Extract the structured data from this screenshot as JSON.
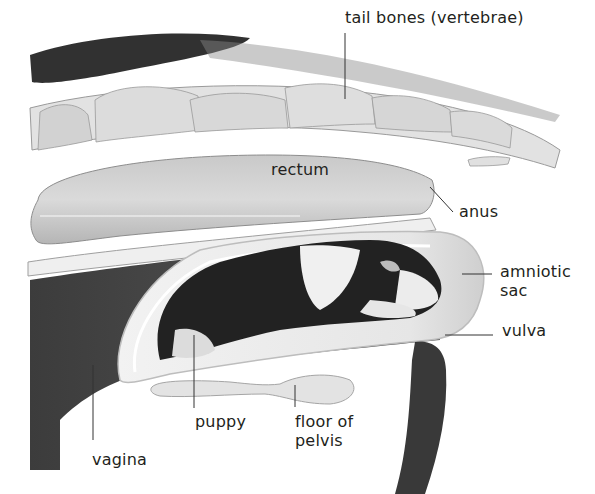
{
  "diagram": {
    "labels": {
      "tail_bones": "tail bones (vertebrae)",
      "rectum": "rectum",
      "anus": "anus",
      "amniotic_sac": "amniotic\nsac",
      "vulva": "vulva",
      "puppy": "puppy",
      "floor_of_pelvis": "floor of\npelvis",
      "vagina": "vagina"
    }
  },
  "colors": {
    "text": "#231f20",
    "fur_dark": "#1e1e1e",
    "tissue_light": "#d9d9d9",
    "tissue_mid": "#a8a8a8",
    "canal_dark": "#3a3a3a",
    "bone": "#e4e4e4",
    "leader_line": "#333333"
  }
}
